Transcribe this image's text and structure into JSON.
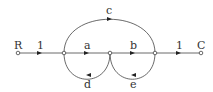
{
  "diagram": {
    "type": "signal-flow-graph",
    "nodes": [
      {
        "id": "R",
        "label": "R",
        "x": 18,
        "y": 53
      },
      {
        "id": "n1",
        "label": "",
        "x": 64,
        "y": 53
      },
      {
        "id": "n2",
        "label": "",
        "x": 110,
        "y": 53
      },
      {
        "id": "n3",
        "label": "",
        "x": 155,
        "y": 53
      },
      {
        "id": "C",
        "label": "C",
        "x": 201,
        "y": 53
      }
    ],
    "branches": [
      {
        "from": "R",
        "to": "n1",
        "gain": "1"
      },
      {
        "from": "n1",
        "to": "n2",
        "gain": "a"
      },
      {
        "from": "n2",
        "to": "n3",
        "gain": "b"
      },
      {
        "from": "n3",
        "to": "C",
        "gain": "1"
      },
      {
        "from": "n1",
        "to": "n3",
        "gain": "c",
        "kind": "feedforward-arc-top"
      },
      {
        "from": "n2",
        "to": "n1",
        "gain": "d",
        "kind": "feedback-arc-bottom"
      },
      {
        "from": "n3",
        "to": "n2",
        "gain": "e",
        "kind": "feedback-arc-bottom"
      }
    ]
  }
}
